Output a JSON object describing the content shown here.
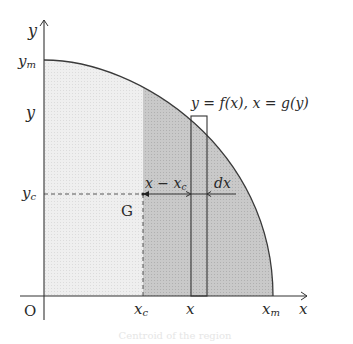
{
  "diagram": {
    "labels": {
      "y_axis": "y",
      "x_axis": "x",
      "origin": "O",
      "y_max": "y",
      "y_max_sub": "m",
      "y_level": "y",
      "y_centroid": "y",
      "y_centroid_sub": "c",
      "x_centroid": "x",
      "x_centroid_sub": "c",
      "x_level": "x",
      "x_max": "x",
      "x_max_sub": "m",
      "centroid_point": "G",
      "curve_equation": "y = f(x), x = g(y)",
      "distance_label": "x − x",
      "distance_label_sub": "c",
      "strip_width": "dx"
    },
    "colors": {
      "light_region": "#ececec",
      "dark_region": "#c4c4c4",
      "strip_fill": "#cfcfcf",
      "lines": "#333333",
      "background": "#ffffff"
    },
    "geometry": {
      "origin": [
        44,
        296
      ],
      "y_max_point": [
        44,
        60
      ],
      "x_max_point": [
        273,
        296
      ],
      "centroid": [
        143,
        194
      ],
      "strip_x_range": [
        191,
        207
      ],
      "strip_top": 116
    }
  },
  "caption": {
    "text": "Centroid of the region"
  }
}
